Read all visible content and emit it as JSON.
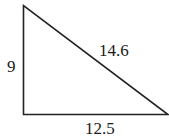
{
  "diagram": {
    "type": "right-triangle",
    "stroke_color": "#222222",
    "sides": {
      "vertical": {
        "label": "9"
      },
      "hypotenuse": {
        "label": "14.6"
      },
      "horizontal": {
        "label": "12.5"
      }
    }
  }
}
